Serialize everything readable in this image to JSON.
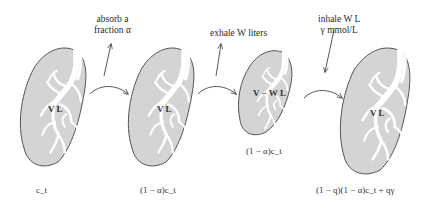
{
  "diagram": {
    "stages": [
      {
        "id": "start",
        "volume_label": "V L",
        "concentration": "c_t"
      },
      {
        "id": "after-absorb",
        "volume_label": "V L",
        "concentration": "(1 − α)c_t"
      },
      {
        "id": "after-exhale",
        "volume_label": "V − W L",
        "concentration": "(1 − α)c_t"
      },
      {
        "id": "after-inhale",
        "volume_label": "V L",
        "concentration": "(1 − q)(1 − α)c_t + qγ"
      }
    ],
    "processes": [
      {
        "id": "absorb",
        "line1": "absorb a",
        "line2": "fraction α",
        "direction": "out"
      },
      {
        "id": "exhale",
        "line1": "exhale W liters",
        "line2": "",
        "direction": "out"
      },
      {
        "id": "inhale",
        "line1": "inhale W L",
        "line2": "γ mmol/L",
        "direction": "in"
      }
    ],
    "colors": {
      "lung_fill": "#d4d4d4",
      "lung_outline": "#555555",
      "airway": "#ffffff",
      "arrow": "#444444"
    }
  }
}
